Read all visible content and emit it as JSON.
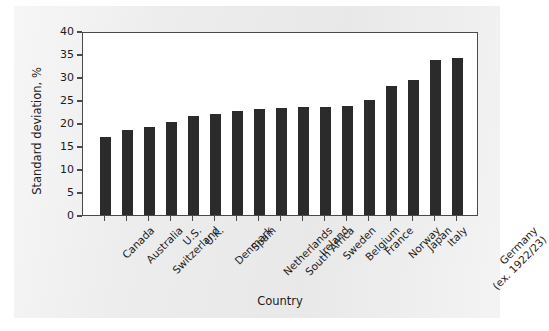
{
  "chart_data": {
    "type": "bar",
    "title": "",
    "xlabel": "Country",
    "ylabel": "Standard deviation, %",
    "ylim": [
      0,
      40
    ],
    "yticks": [
      0,
      5,
      10,
      15,
      20,
      25,
      30,
      35,
      40
    ],
    "grid": false,
    "legend": null,
    "bar_color": "#2b2b2b",
    "categories": [
      "Canada",
      "Australia",
      "Switzerland",
      "U.S.",
      "U.K.",
      "Denmark",
      "Spain",
      "Netherlands",
      "South Africa",
      "Ireland",
      "Sweden",
      "Belgium",
      "France",
      "Norway",
      "Japan",
      "Italy",
      "Germany (ex. 1922/23)"
    ],
    "category_lines": [
      [
        "Canada"
      ],
      [
        "Australia"
      ],
      [
        "Switzerland"
      ],
      [
        "U.S."
      ],
      [
        "U.K."
      ],
      [
        "Denmark"
      ],
      [
        "Spain"
      ],
      [
        "Netherlands"
      ],
      [
        "South Africa"
      ],
      [
        "Ireland"
      ],
      [
        "Sweden"
      ],
      [
        "Belgium"
      ],
      [
        "France"
      ],
      [
        "Norway"
      ],
      [
        "Japan"
      ],
      [
        "Italy"
      ],
      [
        "Germany",
        "(ex. 1922/23)"
      ]
    ],
    "values": [
      17.0,
      18.4,
      19.1,
      20.2,
      21.6,
      22.0,
      22.7,
      23.1,
      23.2,
      23.4,
      23.4,
      23.8,
      25.0,
      28.1,
      29.4,
      33.7,
      34.1
    ]
  }
}
